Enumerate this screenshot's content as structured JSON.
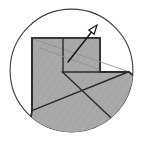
{
  "figure": {
    "caption": "",
    "background_color": "#ffffff",
    "width": 145,
    "height": 143
  },
  "circle": {
    "name": "boundary-circle",
    "center_x": 71.5,
    "center_y": 70.5,
    "radius": 62,
    "stroke_color": "#3b3b3b",
    "stroke_width": 1.1,
    "fill_color": "#ffffff"
  },
  "shaded_region": {
    "name": "shaded-polygon",
    "fill_color": "#a8a8a8",
    "stroke_color": "#2a2a2a",
    "stroke_width": 1.6,
    "points": "32,38 100,38 100,72 128,72 132,78 124,100 108,118 86,130 62,131 40,122 24,106 32,110",
    "vertices": [
      {
        "label": "top-left",
        "x": 32,
        "y": 38
      },
      {
        "label": "top-right",
        "x": 100,
        "y": 38
      },
      {
        "label": "notch-inner",
        "x": 100,
        "y": 72
      },
      {
        "label": "right-arc-start",
        "x": 128,
        "y": 72
      },
      {
        "label": "bottom-left-arc",
        "x": 32,
        "y": 110
      }
    ]
  },
  "fold_lines": [
    {
      "name": "notch-horizontal-edge",
      "x1": 63,
      "y1": 72,
      "x2": 128,
      "y2": 72
    },
    {
      "name": "notch-vertical-edge",
      "x1": 63,
      "y1": 72,
      "x2": 63,
      "y2": 38
    },
    {
      "name": "left-vertical-edge",
      "x1": 32,
      "y1": 38,
      "x2": 32,
      "y2": 110
    },
    {
      "name": "main-diagonal",
      "x1": 32,
      "y1": 110,
      "x2": 128,
      "y2": 72
    },
    {
      "name": "lower-diagonal",
      "x1": 63,
      "y1": 72,
      "x2": 128,
      "y2": 133
    },
    {
      "name": "top-diagonal",
      "x1": 32,
      "y1": 38,
      "x2": 128,
      "y2": 72
    }
  ],
  "arrow": {
    "name": "direction-arrow",
    "tail_x": 68,
    "tail_y": 62,
    "tip_x": 97,
    "tip_y": 25,
    "color": "#151515",
    "head_fill": "#ffffff",
    "label": ""
  },
  "labels": []
}
